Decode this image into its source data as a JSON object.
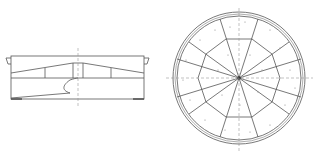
{
  "drawing": {
    "title": "Technical drawing: side elevation and plan view of a circular segmented cover",
    "views": [
      {
        "name": "side-elevation",
        "description": "Side section view with tapered top segments and partial cut-away"
      },
      {
        "name": "plan-view",
        "description": "Circular plan view with concentric outer rings, inner decagon and 10 radial segments"
      }
    ],
    "plan": {
      "segments": 10,
      "outer_rings": 2
    },
    "colors": {
      "line": "#555555",
      "centerline": "#999999",
      "background": "#ffffff"
    }
  }
}
